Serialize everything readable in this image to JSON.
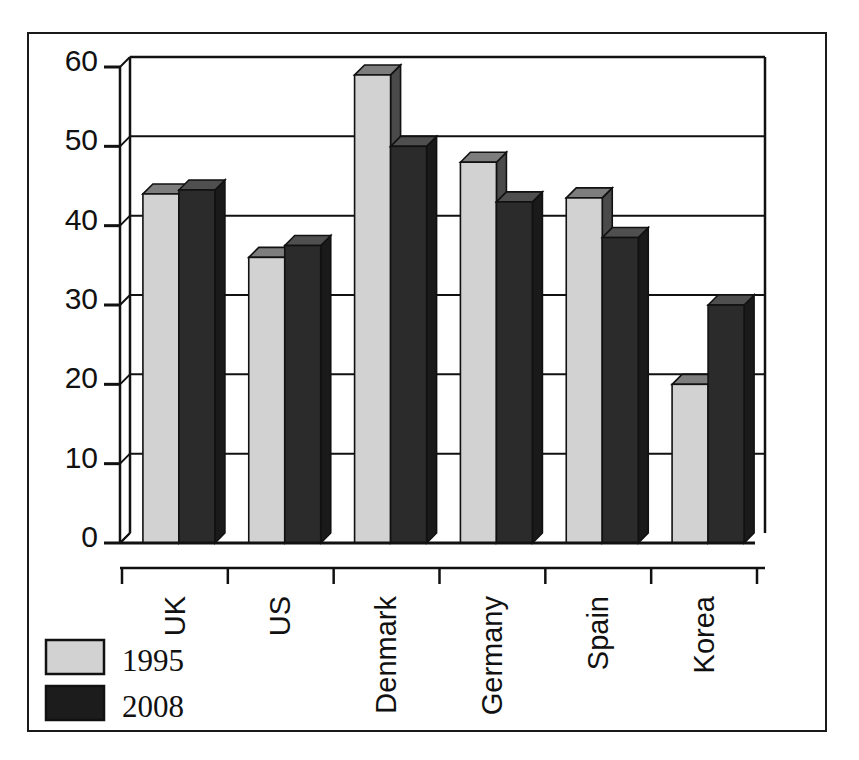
{
  "chart_data": {
    "type": "bar",
    "title": "",
    "subtitle": "",
    "xlabel": "",
    "ylabel": "",
    "categories": [
      "UK",
      "US",
      "Denmark",
      "Germany",
      "Spain",
      "Korea"
    ],
    "series": [
      {
        "name": "1995",
        "color": "#d2d2d2",
        "values": [
          44,
          36,
          59,
          48,
          43.5,
          20
        ]
      },
      {
        "name": "2008",
        "color": "#2b2b2b",
        "values": [
          44.5,
          37.5,
          50,
          43,
          38.5,
          30
        ]
      }
    ],
    "ylim": [
      0,
      60
    ],
    "yticks": [
      0,
      10,
      20,
      30,
      40,
      50,
      60
    ],
    "ytick_labels": [
      "0",
      "10",
      "20",
      "30",
      "40",
      "50",
      "60"
    ],
    "grid": true,
    "grid_axis": "y",
    "legend_position": "bottom-left",
    "style": "3d-columns",
    "bar_style": {
      "depth_x": 10,
      "depth_y": 10,
      "top_face_color": "#7d7d7d",
      "side_face_color": "#4a4a4a",
      "dark_top_face_color": "#4f4f4f",
      "dark_side_face_color": "#1a1a1a",
      "outline_color": "#111111"
    }
  },
  "legend": {
    "items": [
      {
        "label": "1995",
        "swatch_color": "#d2d2d2"
      },
      {
        "label": "2008",
        "swatch_color": "#1c1c1c"
      }
    ]
  },
  "axes": {
    "y_axis_name": "value-axis",
    "x_axis_name": "category-axis",
    "frame_color": "#111111"
  },
  "colors": {
    "background": "#ffffff",
    "ink": "#111111",
    "light_series": "#d2d2d2",
    "dark_series": "#2b2b2b",
    "grid": "#111111"
  }
}
